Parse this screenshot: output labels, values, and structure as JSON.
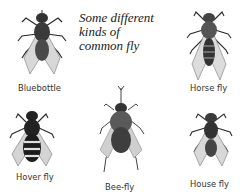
{
  "title": {
    "lines": [
      "Some different",
      "kinds of",
      "common fly"
    ]
  },
  "flies": [
    {
      "name": "Bluebottle",
      "icon": "bluebottle-fly-icon"
    },
    {
      "name": "Horse fly",
      "icon": "horse-fly-icon"
    },
    {
      "name": "Hover fly",
      "icon": "hover-fly-icon"
    },
    {
      "name": "Bee-fly",
      "icon": "bee-fly-icon"
    },
    {
      "name": "House fly",
      "icon": "house-fly-icon"
    }
  ],
  "colors": {
    "ink": "#2a2a2a",
    "wing": "#cfcfcf",
    "background": "#ffffff"
  }
}
